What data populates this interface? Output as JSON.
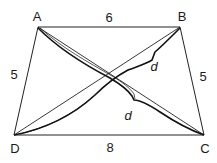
{
  "figure": {
    "shape": "isosceles trapezoid",
    "vertices": {
      "A": {
        "label": "A",
        "x": 38,
        "y": 27
      },
      "B": {
        "label": "B",
        "x": 180,
        "y": 27
      },
      "C": {
        "label": "C",
        "x": 204,
        "y": 135
      },
      "D": {
        "label": "D",
        "x": 14,
        "y": 135
      }
    },
    "side_labels": {
      "AB": "6",
      "DC": "8",
      "AD": "5",
      "BC": "5"
    },
    "diagonal_labels": {
      "BD": "d",
      "AC": "d"
    },
    "line_color": "#222222",
    "brace_color": "#111111"
  }
}
